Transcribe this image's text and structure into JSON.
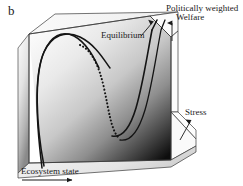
{
  "figure": {
    "panel_letter": "b",
    "type": "3d-surface-diagram"
  },
  "labels": {
    "politically_weighted": "Politically weighted",
    "welfare": "Welfare",
    "equilibrium": "Equilibrium",
    "stress": "Stress",
    "ecosystem_state": "Ecosystem state"
  },
  "axes": [
    {
      "name": "ecosystem-state-axis",
      "label": "Ecosystem state",
      "direction": "horizontal-right"
    },
    {
      "name": "stress-axis",
      "label": "Stress",
      "direction": "diagonal-up-right"
    },
    {
      "name": "welfare-axis",
      "label": "Politically weighted Welfare",
      "direction": "vertical-up"
    }
  ],
  "curves": [
    {
      "name": "stable-branch-front",
      "style": "solid",
      "meaning": "stable equilibrium"
    },
    {
      "name": "unstable-branch",
      "style": "dotted",
      "meaning": "unstable equilibrium"
    },
    {
      "name": "stable-branch-back",
      "style": "solid",
      "meaning": "stable equilibrium"
    }
  ],
  "colors": {
    "line": "#1a1a1a",
    "surface_light": "#f2f2f2",
    "surface_dark": "#101010",
    "background": "#ffffff"
  }
}
